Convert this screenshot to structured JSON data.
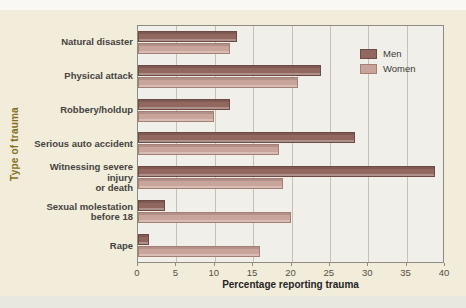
{
  "figure": {
    "y_axis_title": "Type of trauma",
    "x_axis_title": "Percentage reporting trauma"
  },
  "colors": {
    "page_background": "#f2ecdb",
    "plot_background": "#f1efe9",
    "grid": "#c6c1b1",
    "axis_title_y": "#84701a",
    "men_fill": "#916760",
    "men_border": "#6d4a44",
    "women_fill": "#c9a49b",
    "women_border": "#a57e74"
  },
  "chart_data": {
    "type": "bar",
    "orientation": "horizontal",
    "title": "",
    "xlabel": "Percentage reporting trauma",
    "ylabel": "Type of trauma",
    "xlim": [
      0,
      40
    ],
    "xticks": [
      0,
      5,
      10,
      15,
      20,
      25,
      30,
      35,
      40
    ],
    "grid": true,
    "legend_position": "upper right",
    "categories": [
      "Natural disaster",
      "Physical attack",
      "Robbery/holdup",
      "Serious auto accident",
      "Witnessing severe injury\nor death",
      "Sexual molestation\nbefore 18",
      "Rape"
    ],
    "series": [
      {
        "name": "Men",
        "color": "#916760",
        "border": "#6d4a44",
        "values": [
          13,
          24,
          12,
          28.5,
          39,
          3.5,
          1.5
        ]
      },
      {
        "name": "Women",
        "color": "#c9a49b",
        "border": "#a57e74",
        "values": [
          12,
          21,
          10,
          18.5,
          19,
          20,
          16
        ]
      }
    ]
  }
}
